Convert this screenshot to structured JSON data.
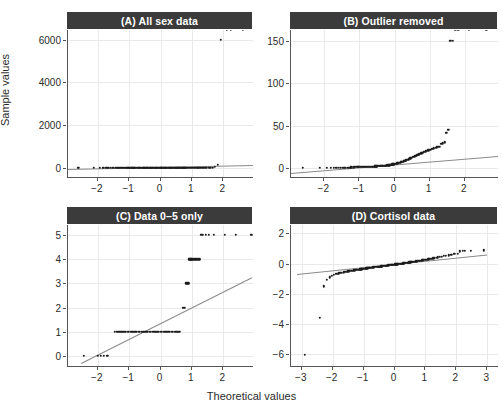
{
  "figure": {
    "ylabel": "Sample values",
    "xlabel": "Theoretical values",
    "point_color": "#1c1c1c",
    "line_color": "#8a8a8a",
    "strip_bg": "#3b3b3b",
    "strip_fg": "#ffffff",
    "grid_color": "#e9e9e9"
  },
  "chart_data": [
    {
      "id": "A",
      "type": "scatter",
      "title": "(A) All sex data",
      "xlabel": "Theoretical values",
      "ylabel": "Sample values",
      "subplot": "top-left",
      "grid": true,
      "xlim": [
        -2.95,
        2.95
      ],
      "ylim": [
        -420,
        6450
      ],
      "xticks": [
        -2,
        -1,
        0,
        1,
        2
      ],
      "yticks": [
        0,
        2000,
        4000,
        6000
      ],
      "xticklabels": [
        "−2",
        "−1",
        "0",
        "1",
        "2"
      ],
      "yticklabels": [
        "0",
        "2000",
        "4000",
        "6000"
      ],
      "qq_line": {
        "x1": -2.95,
        "y1": -60,
        "x2": 2.95,
        "y2": 130
      },
      "x": [
        -2.62,
        -2.12,
        -1.93,
        -1.82,
        -1.73,
        -1.66,
        -1.59,
        -1.53,
        -1.48,
        -1.43,
        -1.38,
        -1.33,
        -1.29,
        -1.25,
        -1.21,
        -1.17,
        -1.13,
        -1.1,
        -1.06,
        -1.03,
        -1.0,
        -0.96,
        -0.93,
        -0.9,
        -0.87,
        -0.84,
        -0.81,
        -0.79,
        -0.76,
        -0.73,
        -0.7,
        -0.68,
        -0.65,
        -0.62,
        -0.6,
        -0.57,
        -0.55,
        -0.52,
        -0.5,
        -0.47,
        -0.45,
        -0.42,
        -0.4,
        -0.38,
        -0.35,
        -0.33,
        -0.31,
        -0.28,
        -0.26,
        -0.24,
        -0.21,
        -0.19,
        -0.17,
        -0.15,
        -0.12,
        -0.1,
        -0.08,
        -0.06,
        -0.03,
        -0.01,
        0.01,
        0.03,
        0.06,
        0.08,
        0.1,
        0.12,
        0.15,
        0.17,
        0.19,
        0.21,
        0.24,
        0.26,
        0.28,
        0.31,
        0.33,
        0.35,
        0.38,
        0.4,
        0.42,
        0.45,
        0.47,
        0.5,
        0.52,
        0.55,
        0.57,
        0.6,
        0.62,
        0.65,
        0.68,
        0.7,
        0.73,
        0.76,
        0.79,
        0.81,
        0.84,
        0.87,
        0.9,
        0.93,
        0.96,
        1.0,
        1.03,
        1.06,
        1.1,
        1.13,
        1.17,
        1.21,
        1.25,
        1.29,
        1.33,
        1.38,
        1.43,
        1.48,
        1.53,
        1.59,
        1.66,
        1.73,
        1.82,
        1.93,
        2.12,
        2.25,
        2.62
      ],
      "y": [
        0,
        0,
        0,
        0,
        0,
        0,
        0,
        0,
        0,
        0,
        0,
        0,
        0,
        0,
        0,
        0,
        0,
        0,
        0,
        0,
        0,
        0,
        0,
        0,
        0,
        0,
        0,
        0,
        0,
        0,
        0,
        0,
        0,
        0,
        0,
        0,
        0,
        0,
        0,
        0,
        0,
        0,
        0,
        0,
        0,
        0,
        0,
        0,
        0,
        0,
        0,
        0,
        0,
        0,
        0,
        0,
        0,
        0,
        0,
        0,
        0,
        0,
        0,
        0,
        0,
        0,
        0,
        0,
        0,
        0,
        0,
        0,
        0,
        0,
        0,
        0,
        0,
        0,
        0,
        0,
        0,
        0,
        0,
        0,
        0,
        0,
        0,
        0,
        0,
        0,
        0,
        0,
        0,
        0,
        0,
        0,
        0,
        0,
        0,
        0,
        0,
        0,
        0,
        0,
        0,
        0,
        0,
        1,
        1,
        2,
        3,
        5,
        8,
        12,
        20,
        45,
        150,
        5980
      ]
    },
    {
      "id": "B",
      "type": "scatter",
      "title": "(B) Outlier removed",
      "xlabel": "Theoretical values",
      "ylabel": "Sample values",
      "subplot": "top-right",
      "grid": true,
      "xlim": [
        -2.95,
        2.95
      ],
      "ylim": [
        -11,
        163
      ],
      "xticks": [
        -2,
        -1,
        0,
        1,
        2
      ],
      "yticks": [
        0,
        50,
        100,
        150
      ],
      "xticklabels": [
        "−2",
        "−1",
        "0",
        "1",
        "2"
      ],
      "yticklabels": [
        "0",
        "50",
        "100",
        "150"
      ],
      "qq_line": {
        "x1": -2.95,
        "y1": -6.5,
        "x2": 2.95,
        "y2": 13.5
      },
      "x": [
        -2.62,
        -2.12,
        -1.93,
        -1.82,
        -1.73,
        -1.66,
        -1.59,
        -1.53,
        -1.48,
        -1.43,
        -1.38,
        -1.33,
        -1.29,
        -1.25,
        -1.21,
        -1.17,
        -1.13,
        -1.1,
        -1.06,
        -1.03,
        -1.0,
        -0.96,
        -0.93,
        -0.9,
        -0.87,
        -0.84,
        -0.81,
        -0.79,
        -0.76,
        -0.73,
        -0.7,
        -0.68,
        -0.65,
        -0.62,
        -0.6,
        -0.57,
        -0.55,
        -0.52,
        -0.5,
        -0.47,
        -0.45,
        -0.42,
        -0.4,
        -0.38,
        -0.35,
        -0.33,
        -0.31,
        -0.28,
        -0.26,
        -0.24,
        -0.21,
        -0.19,
        -0.17,
        -0.15,
        -0.12,
        -0.1,
        -0.08,
        -0.06,
        -0.03,
        -0.01,
        0.01,
        0.03,
        0.06,
        0.08,
        0.1,
        0.12,
        0.15,
        0.17,
        0.19,
        0.21,
        0.24,
        0.26,
        0.28,
        0.31,
        0.33,
        0.35,
        0.38,
        0.4,
        0.42,
        0.45,
        0.47,
        0.5,
        0.52,
        0.55,
        0.57,
        0.6,
        0.62,
        0.65,
        0.68,
        0.7,
        0.73,
        0.76,
        0.79,
        0.81,
        0.84,
        0.87,
        0.9,
        0.93,
        0.96,
        1.0,
        1.03,
        1.06,
        1.1,
        1.13,
        1.17,
        1.21,
        1.25,
        1.29,
        1.33,
        1.38,
        1.43,
        1.48,
        1.53,
        1.59,
        1.66,
        1.73,
        1.82,
        2.12,
        2.62
      ],
      "y": [
        0,
        0,
        0,
        0,
        0,
        0,
        0,
        0,
        0,
        0,
        0,
        0,
        0.3,
        0.4,
        0.5,
        0.6,
        0.7,
        0.8,
        0.9,
        1,
        1,
        1,
        1,
        1,
        1,
        1,
        1,
        1,
        1,
        1,
        1,
        1,
        1.2,
        1.3,
        1.4,
        1.5,
        1.6,
        1.7,
        1.8,
        1.9,
        2,
        2,
        2,
        2,
        2,
        2,
        2,
        2.2,
        2.4,
        2.6,
        2.8,
        3,
        3,
        3,
        3.2,
        3.5,
        3.8,
        4,
        4,
        4.2,
        4.5,
        4.8,
        5,
        5.2,
        5.5,
        5.8,
        6,
        6.3,
        6.6,
        7,
        7.3,
        7.6,
        8,
        8.4,
        8.8,
        9.2,
        9.6,
        10,
        10.5,
        11,
        11.5,
        12,
        12.5,
        13,
        13.5,
        14,
        14.5,
        15,
        15.5,
        16,
        16.5,
        17,
        17.5,
        18,
        18.5,
        19,
        19.5,
        20,
        20.5,
        21,
        21.5,
        22,
        22.5,
        23,
        23.5,
        24,
        24.5,
        25,
        28,
        29,
        30,
        41,
        45,
        150,
        150
      ]
    },
    {
      "id": "C",
      "type": "scatter",
      "title": "(C) Data 0–5 only",
      "xlabel": "Theoretical values",
      "ylabel": "Sample values",
      "subplot": "bottom-left",
      "grid": true,
      "xlim": [
        -2.95,
        2.95
      ],
      "ylim": [
        -0.42,
        5.42
      ],
      "xticks": [
        -2,
        -1,
        0,
        1,
        2
      ],
      "yticks": [
        0,
        1,
        2,
        3,
        4,
        5
      ],
      "xticklabels": [
        "−2",
        "−1",
        "0",
        "1",
        "2"
      ],
      "yticklabels": [
        "0",
        "1",
        "2",
        "3",
        "4",
        "5"
      ],
      "qq_line": {
        "x1": -2.55,
        "y1": -0.3,
        "x2": 2.9,
        "y2": 3.25
      },
      "x": [
        -2.45,
        -2.0,
        -1.9,
        -1.8,
        -1.7,
        -1.45,
        -1.4,
        -1.35,
        -1.3,
        -1.25,
        -1.2,
        -1.15,
        -1.1,
        -1.05,
        -1.0,
        -0.95,
        -0.9,
        -0.85,
        -0.8,
        -0.75,
        -0.7,
        -0.65,
        -0.6,
        -0.55,
        -0.5,
        -0.45,
        -0.4,
        -0.35,
        -0.3,
        -0.25,
        -0.2,
        -0.15,
        -0.1,
        -0.05,
        0.0,
        0.05,
        0.1,
        0.15,
        0.2,
        0.25,
        0.3,
        0.35,
        0.4,
        0.45,
        0.5,
        0.55,
        0.6,
        0.72,
        0.75,
        0.78,
        0.8,
        0.83,
        0.86,
        0.89,
        0.92,
        0.95,
        0.98,
        1.0,
        1.03,
        1.06,
        1.09,
        1.12,
        1.15,
        1.18,
        1.22,
        1.26,
        1.3,
        1.35,
        1.45,
        1.55,
        1.7,
        2.05,
        2.4,
        2.9
      ],
      "y": [
        0,
        0,
        0,
        0,
        0,
        1,
        1,
        1,
        1,
        1,
        1,
        1,
        1,
        1,
        1,
        1,
        1,
        1,
        1,
        1,
        1,
        1,
        1,
        1,
        1,
        1,
        1,
        1,
        1,
        1,
        1,
        1,
        1,
        1,
        1,
        1,
        1,
        1,
        1,
        1,
        1,
        1,
        1,
        1,
        1,
        1,
        1,
        2,
        2,
        2,
        3,
        3,
        3,
        3,
        4,
        4,
        4,
        4,
        4,
        4,
        4,
        4,
        4,
        4,
        4,
        4,
        5,
        5,
        5,
        5,
        5,
        5,
        5,
        5
      ]
    },
    {
      "id": "D",
      "type": "scatter",
      "title": "(D) Cortisol data",
      "xlabel": "Theoretical values",
      "ylabel": "Sample values",
      "subplot": "bottom-right",
      "grid": true,
      "xlim": [
        -3.35,
        3.35
      ],
      "ylim": [
        -6.8,
        2.55
      ],
      "xticks": [
        -3,
        -2,
        -1,
        0,
        1,
        2,
        3
      ],
      "yticks": [
        -6,
        -4,
        -2,
        0,
        2
      ],
      "xticklabels": [
        "−3",
        "−2",
        "−1",
        "0",
        "1",
        "2",
        "3"
      ],
      "yticklabels": [
        "−6",
        "−4",
        "−2",
        "0",
        "2"
      ],
      "qq_line": {
        "x1": -3.15,
        "y1": -0.72,
        "x2": 3.0,
        "y2": 0.58
      },
      "x": [
        -2.9,
        -2.42,
        -2.28,
        -2.18,
        -2.1,
        -2.03,
        -1.97,
        -1.91,
        -1.85,
        -1.8,
        -1.75,
        -1.7,
        -1.65,
        -1.6,
        -1.56,
        -1.52,
        -1.48,
        -1.44,
        -1.4,
        -1.36,
        -1.32,
        -1.28,
        -1.25,
        -1.21,
        -1.18,
        -1.14,
        -1.11,
        -1.07,
        -1.04,
        -1.01,
        -0.97,
        -0.94,
        -0.91,
        -0.88,
        -0.85,
        -0.82,
        -0.79,
        -0.76,
        -0.73,
        -0.7,
        -0.67,
        -0.64,
        -0.61,
        -0.58,
        -0.55,
        -0.52,
        -0.49,
        -0.46,
        -0.43,
        -0.41,
        -0.38,
        -0.35,
        -0.32,
        -0.29,
        -0.27,
        -0.24,
        -0.21,
        -0.18,
        -0.16,
        -0.13,
        -0.1,
        -0.07,
        -0.05,
        -0.02,
        0.01,
        0.03,
        0.06,
        0.09,
        0.11,
        0.14,
        0.17,
        0.2,
        0.22,
        0.25,
        0.28,
        0.31,
        0.34,
        0.36,
        0.39,
        0.42,
        0.45,
        0.48,
        0.51,
        0.54,
        0.57,
        0.6,
        0.63,
        0.66,
        0.69,
        0.73,
        0.76,
        0.79,
        0.83,
        0.86,
        0.9,
        0.93,
        0.97,
        1.01,
        1.05,
        1.09,
        1.13,
        1.17,
        1.21,
        1.26,
        1.31,
        1.36,
        1.41,
        1.47,
        1.53,
        1.6,
        1.67,
        1.75,
        1.84,
        1.94,
        2.06,
        2.12,
        2.2,
        2.28,
        2.48,
        2.9
      ],
      "y": [
        -6.05,
        -3.6,
        -1.52,
        -1.1,
        -0.92,
        -0.8,
        -0.73,
        -0.7,
        -0.67,
        -0.65,
        -0.63,
        -0.61,
        -0.59,
        -0.57,
        -0.55,
        -0.53,
        -0.52,
        -0.5,
        -0.49,
        -0.47,
        -0.46,
        -0.45,
        -0.43,
        -0.42,
        -0.41,
        -0.4,
        -0.39,
        -0.38,
        -0.37,
        -0.36,
        -0.35,
        -0.34,
        -0.33,
        -0.32,
        -0.31,
        -0.3,
        -0.29,
        -0.28,
        -0.27,
        -0.26,
        -0.25,
        -0.24,
        -0.24,
        -0.23,
        -0.22,
        -0.21,
        -0.2,
        -0.2,
        -0.19,
        -0.18,
        -0.17,
        -0.17,
        -0.16,
        -0.15,
        -0.14,
        -0.14,
        -0.13,
        -0.12,
        -0.11,
        -0.11,
        -0.1,
        -0.09,
        -0.08,
        -0.08,
        -0.07,
        -0.06,
        -0.05,
        -0.05,
        -0.04,
        -0.03,
        -0.02,
        -0.01,
        -0.01,
        0.0,
        0.01,
        0.02,
        0.03,
        0.03,
        0.04,
        0.05,
        0.06,
        0.07,
        0.08,
        0.09,
        0.1,
        0.11,
        0.12,
        0.13,
        0.14,
        0.15,
        0.16,
        0.17,
        0.18,
        0.19,
        0.2,
        0.22,
        0.23,
        0.25,
        0.26,
        0.28,
        0.29,
        0.31,
        0.33,
        0.35,
        0.37,
        0.39,
        0.41,
        0.44,
        0.46,
        0.49,
        0.52,
        0.55,
        0.58,
        0.62,
        0.66,
        0.8,
        0.82,
        0.84,
        0.86,
        0.88,
        2.0
      ]
    }
  ]
}
